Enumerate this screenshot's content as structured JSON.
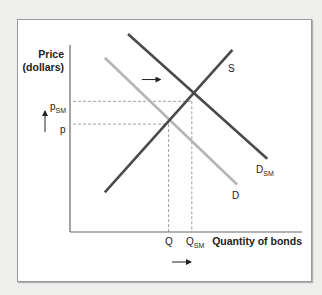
{
  "chart_data": {
    "type": "line",
    "title": "",
    "xlabel": "Quantity of bonds",
    "ylabel": "Price (dollars)",
    "ylabel_lines": [
      "Price",
      "(dollars)"
    ],
    "grid": false,
    "xlim": [
      0,
      100
    ],
    "ylim": [
      0,
      100
    ],
    "series": [
      {
        "name": "S",
        "label": "S",
        "color": "#4a4a4a",
        "points": [
          [
            15,
            20
          ],
          [
            70,
            92
          ]
        ]
      },
      {
        "name": "D_SM",
        "label": "D",
        "label_sub": "SM",
        "color": "#4a4a4a",
        "points": [
          [
            25,
            100
          ],
          [
            85,
            37
          ]
        ]
      },
      {
        "name": "D",
        "label": "D",
        "label_sub": "",
        "color": "#b5b5b5",
        "points": [
          [
            15,
            88
          ],
          [
            72,
            24
          ]
        ]
      }
    ],
    "equilibria": [
      {
        "name": "original",
        "price_label": "p",
        "price_sub": "",
        "quantity_label": "Q",
        "quantity_sub": "",
        "x": 42.5,
        "y": 54.5
      },
      {
        "name": "shifted",
        "price_label": "p",
        "price_sub": "SM",
        "quantity_label": "Q",
        "quantity_sub": "SM",
        "x": 52.5,
        "y": 66
      }
    ],
    "annotations": [
      {
        "name": "demand-shift-arrow",
        "direction": "right",
        "from": [
          31,
          77
        ],
        "to": [
          39,
          77
        ]
      },
      {
        "name": "price-increase-arrow",
        "direction": "up"
      },
      {
        "name": "quantity-increase-arrow",
        "direction": "right"
      }
    ]
  },
  "labels": {
    "x_axis": "Quantity of bonds",
    "y_axis_line1": "Price",
    "y_axis_line2": "(dollars)",
    "s": "S",
    "d": "D",
    "d_sm_main": "D",
    "d_sm_sub": "SM",
    "p": "p",
    "p_sm_main": "p",
    "p_sm_sub": "SM",
    "q": "Q",
    "q_sm_main": "Q",
    "q_sm_sub": "SM"
  }
}
